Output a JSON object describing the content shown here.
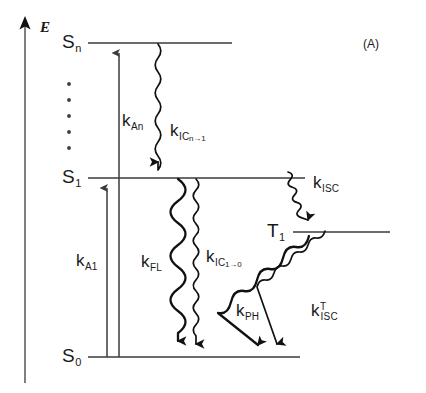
{
  "figure": {
    "panel_label": "(A)",
    "axis": {
      "label": "E",
      "name": "energy-axis"
    },
    "states": [
      {
        "id": "Sn",
        "base": "S",
        "sub": "n",
        "label": "S",
        "y": 43
      },
      {
        "id": "S1",
        "base": "S",
        "sub": "1",
        "label": "S",
        "y": 178
      },
      {
        "id": "T1",
        "base": "T",
        "sub": "1",
        "label": "T",
        "y": 232
      },
      {
        "id": "S0",
        "base": "S",
        "sub": "0",
        "label": "S",
        "y": 357
      }
    ],
    "vertical_dots_count": 5,
    "processes": [
      {
        "id": "kAn",
        "base": "k",
        "sub": "An",
        "kind": "absorption",
        "from": "S0",
        "to": "Sn",
        "description": "absorption to Sn"
      },
      {
        "id": "kA1",
        "base": "k",
        "sub": "A1",
        "kind": "absorption",
        "from": "S0",
        "to": "S1",
        "description": "absorption to S1"
      },
      {
        "id": "kICn1",
        "base": "k",
        "sub": "IC",
        "sub2": "n",
        "arrow": "→",
        "sub3": "1",
        "kind": "internal-conversion",
        "from": "Sn",
        "to": "S1",
        "description": "internal conversion Sn to S1"
      },
      {
        "id": "kFL",
        "base": "k",
        "sub": "FL",
        "kind": "fluorescence",
        "from": "S1",
        "to": "S0",
        "description": "fluorescence"
      },
      {
        "id": "kIC10",
        "base": "k",
        "sub": "IC",
        "sub2": "1",
        "arrow": "→",
        "sub3": "0",
        "kind": "internal-conversion",
        "from": "S1",
        "to": "S0",
        "description": "internal conversion S1 to S0"
      },
      {
        "id": "kISC",
        "base": "k",
        "sub": "ISC",
        "kind": "intersystem-crossing",
        "from": "S1",
        "to": "T1",
        "description": "intersystem crossing S1 to T1"
      },
      {
        "id": "kPH",
        "base": "k",
        "sub": "PH",
        "kind": "phosphorescence",
        "from": "T1",
        "to": "S0",
        "description": "phosphorescence"
      },
      {
        "id": "kISCT",
        "base": "k",
        "sup": "T",
        "sub": "ISC",
        "kind": "intersystem-crossing",
        "from": "T1",
        "to": "S0",
        "description": "triplet intersystem crossing T1 to S0"
      }
    ],
    "colors": {
      "ink": "#111111",
      "line": "#3a3a3a",
      "axis": "#555555",
      "background": "#ffffff"
    }
  }
}
